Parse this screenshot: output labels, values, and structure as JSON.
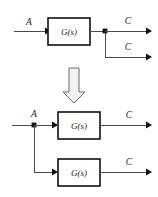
{
  "figure": {
    "background_color": "#ffffff",
    "line_color": "#4a4a4a",
    "box_stroke_color": "#111111",
    "text_color": "#1a1a1a"
  },
  "top_diagram": {
    "name": "original-form",
    "input_label": "A",
    "block": {
      "label": "G(s)"
    },
    "takeoff_point": {
      "type": "junction-dot"
    },
    "outputs": [
      {
        "label": "C"
      },
      {
        "label": "C"
      }
    ]
  },
  "transform_arrow": {
    "direction": "down",
    "style": "hollow-block-arrow"
  },
  "bottom_diagram": {
    "name": "equivalent-form",
    "input_label": "A",
    "takeoff_point": {
      "type": "junction-dot"
    },
    "branches": [
      {
        "block": {
          "label": "G(s)"
        },
        "output_label": "C"
      },
      {
        "block": {
          "label": "G(s)"
        },
        "output_label": "C"
      }
    ]
  }
}
